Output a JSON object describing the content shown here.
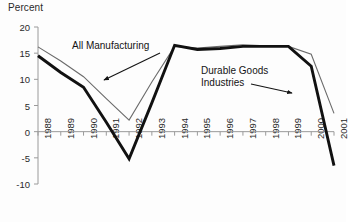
{
  "chart_data": {
    "type": "line",
    "title": "",
    "ylabel": "Percent",
    "xlabel": "",
    "ylim": [
      -10,
      20
    ],
    "grid": false,
    "legend_position": "inline-annotations",
    "categories": [
      "1988",
      "1989",
      "1990",
      "1991",
      "1992",
      "1993",
      "1994",
      "1995",
      "1996",
      "1997",
      "1998",
      "1999",
      "2000",
      "2001"
    ],
    "ytick_labels": [
      "20",
      "15",
      "10",
      "5",
      "0",
      "-5",
      "-10"
    ],
    "ytick_values": [
      20,
      15,
      10,
      5,
      0,
      -5,
      -10
    ],
    "series": [
      {
        "name": "All Manufacturing",
        "style": "thin-gray",
        "color": "#6b6b6b",
        "width": 1.1,
        "values": [
          16.2,
          13.5,
          10.5,
          6.3,
          2.2,
          9.5,
          16.3,
          16.0,
          16.3,
          16.6,
          16.4,
          16.3,
          14.8,
          3.5
        ]
      },
      {
        "name": "Durable Goods Industries",
        "style": "thick-black",
        "color": "#111111",
        "width": 2.9,
        "values": [
          14.5,
          11.3,
          8.5,
          1.8,
          -5.2,
          5.5,
          16.5,
          15.7,
          15.9,
          16.3,
          16.3,
          16.3,
          12.5,
          -6.5
        ]
      }
    ],
    "annotations": [
      {
        "text": "All Manufacturing",
        "target_series": "All Manufacturing"
      },
      {
        "text_line1": "Durable Goods",
        "text_line2": "Industries",
        "target_series": "Durable Goods Industries"
      }
    ]
  },
  "labels": {
    "y_axis_title": "Percent",
    "annotation_all_manufacturing": "All Manufacturing",
    "annotation_durable_line1": "Durable Goods",
    "annotation_durable_line2": "Industries"
  },
  "colors": {
    "axis": "#9a9a9a",
    "text": "#1a1a1a",
    "series_thin": "#6b6b6b",
    "series_thick": "#111111",
    "background": "#fdfdfd"
  }
}
